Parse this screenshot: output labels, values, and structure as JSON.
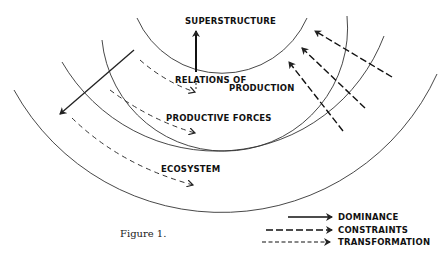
{
  "figure": {
    "caption": "Figure 1.",
    "layers": [
      {
        "id": "superstructure",
        "label": "SUPERSTRUCTURE"
      },
      {
        "id": "relations",
        "label_line1": "RELATIONS OF",
        "label_line2": "PRODUCTION"
      },
      {
        "id": "productive",
        "label": "PRODUCTIVE FORCES"
      },
      {
        "id": "ecosystem",
        "label": "ECOSYSTEM"
      }
    ],
    "legend": [
      {
        "style": "solid",
        "label": "DOMINANCE"
      },
      {
        "style": "long-dash",
        "label": "CONSTRAINTS"
      },
      {
        "style": "short-dash",
        "label": "TRANSFORMATION"
      }
    ],
    "colors": {
      "line": "#222222",
      "background": "#ffffff"
    }
  }
}
